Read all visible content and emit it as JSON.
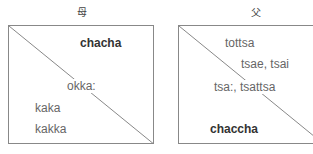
{
  "mother": {
    "title": "母",
    "labels": {
      "top_right": "chacha",
      "center": "okka:",
      "bottom_left_1": "kaka",
      "bottom_left_2": "kakka"
    }
  },
  "father": {
    "title": "父",
    "labels": {
      "top_1": "tottsa",
      "top_2": "tsae, tsai",
      "center": "tsa:, tsattsa",
      "bottom_left": "chaccha"
    }
  }
}
